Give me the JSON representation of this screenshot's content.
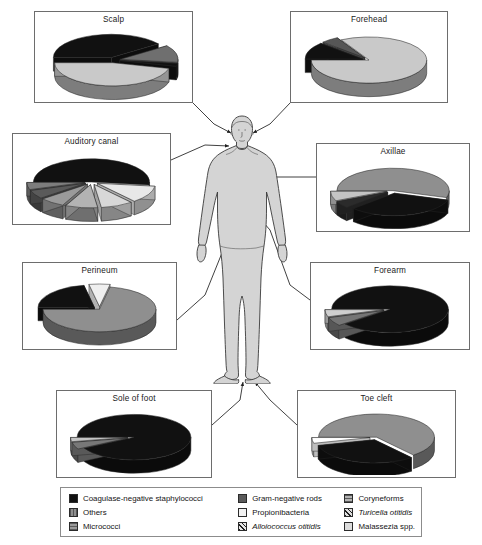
{
  "figure": {
    "body_figure_name": "human-body-silhouette"
  },
  "colors": {
    "cns": "#111111",
    "others": "#8f8f8f",
    "micrococci": "#9a9a9a",
    "gram_negative_rods": "#5a5a5a",
    "propionibacteria": "#f2f2f2",
    "alloiococcus": "#e8e8e8",
    "coryneforms": "#b3b3b3",
    "turicella": "#dedede",
    "malassezia": "#dcdcdc",
    "panel_border": "#6d6d6d",
    "legend_border": "#8c8c8c",
    "body_fill": "#d4d4d4",
    "body_stroke": "#3a3a3a",
    "connector": "#2b2b2b"
  },
  "legend": {
    "name": "taxa-legend",
    "columns": [
      {
        "entries": [
          {
            "label": "Coagulase-negative staphylococci",
            "swatch": "solid",
            "color": "#111111",
            "italic": false
          },
          {
            "label": "Others",
            "swatch": "vstripe",
            "color": "#8f8f8f",
            "italic": false
          },
          {
            "label": "Micrococci",
            "swatch": "grid",
            "color": "#9a9a9a",
            "italic": false
          }
        ]
      },
      {
        "entries": [
          {
            "label": "Gram-negative rods",
            "swatch": "solid",
            "color": "#5a5a5a",
            "italic": false
          },
          {
            "label": "Propionibacteria",
            "swatch": "solid",
            "color": "#f2f2f2",
            "italic": false
          },
          {
            "label": "Alloiococcus otitidis",
            "swatch": "diag",
            "color": "#e8e8e8",
            "italic": true
          }
        ]
      },
      {
        "entries": [
          {
            "label": "Coryneforms",
            "swatch": "hstripe",
            "color": "#b3b3b3",
            "italic": false
          },
          {
            "label": "Turicella otitidis",
            "swatch": "diag",
            "color": "#dedede",
            "italic": true
          },
          {
            "label": "Malassezia spp.",
            "swatch": "solid",
            "color": "#dcdcdc",
            "italic": false
          }
        ]
      }
    ]
  },
  "chart_data": [
    {
      "type": "pie",
      "title": "Scalp",
      "site": "scalp",
      "labels": [
        "Coagulase-negative staphylococci",
        "Coryneforms",
        "Others",
        "Malassezia spp."
      ],
      "values": [
        40,
        12,
        2,
        46
      ],
      "colors": [
        "#111111",
        "#6f6f6f",
        "#111111",
        "#c9c9c9"
      ],
      "exploded": [
        true,
        true,
        true,
        true
      ]
    },
    {
      "type": "pie",
      "title": "Forehead",
      "site": "forehead",
      "labels": [
        "Coagulase-negative staphylococci",
        "Coryneforms",
        "Propionibacteria"
      ],
      "values": [
        12,
        5,
        83
      ],
      "colors": [
        "#111111",
        "#565656",
        "#c9c9c9"
      ],
      "exploded": [
        true,
        true,
        false
      ]
    },
    {
      "type": "pie",
      "title": "Auditory canal",
      "site": "auditory-canal",
      "labels": [
        "Coagulase-negative staphylococci",
        "Alloiococcus otitidis",
        "Turicella otitidis",
        "Coryneforms",
        "Micrococci",
        "Gram-negative rods",
        "Others"
      ],
      "values": [
        52,
        12,
        9,
        9,
        7,
        6,
        5
      ],
      "colors": [
        "#111111",
        "#e8e8e8",
        "#d8d8d8",
        "#b3b3b3",
        "#9a9a9a",
        "#5a5a5a",
        "#7d7d7d"
      ],
      "exploded": [
        false,
        true,
        true,
        true,
        true,
        true,
        true
      ]
    },
    {
      "type": "pie",
      "title": "Axillae",
      "site": "axillae",
      "labels": [
        "Coryneforms",
        "Coagulase-negative staphylococci",
        "Others",
        "Micrococci"
      ],
      "values": [
        55,
        33,
        5,
        7
      ],
      "colors": [
        "#8f8f8f",
        "#111111",
        "#2b2b2b",
        "#c4c4c4"
      ],
      "exploded": [
        false,
        true,
        true,
        true
      ]
    },
    {
      "type": "pie",
      "title": "Perineum",
      "site": "perineum",
      "labels": [
        "Coagulase-negative staphylococci",
        "Gram-negative rods",
        "Coryneforms"
      ],
      "values": [
        22,
        6,
        72
      ],
      "colors": [
        "#111111",
        "#efefef",
        "#8f8f8f"
      ],
      "exploded": [
        true,
        true,
        false
      ]
    },
    {
      "type": "pie",
      "title": "Forearm",
      "site": "forearm",
      "labels": [
        "Coagulase-negative staphylococci",
        "Coryneforms",
        "Propionibacteria"
      ],
      "values": [
        89,
        6,
        5
      ],
      "colors": [
        "#111111",
        "#757575",
        "#cfcfcf"
      ],
      "exploded": [
        false,
        true,
        true
      ]
    },
    {
      "type": "pie",
      "title": "Sole of foot",
      "site": "sole-of-foot",
      "labels": [
        "Coagulase-negative staphylococci",
        "Coryneforms",
        "Micrococci"
      ],
      "values": [
        92,
        5,
        3
      ],
      "colors": [
        "#111111",
        "#787878",
        "#c4c4c4"
      ],
      "exploded": [
        false,
        true,
        true
      ]
    },
    {
      "type": "pie",
      "title": "Toe cleft",
      "site": "toe-cleft",
      "labels": [
        "Coryneforms",
        "Coagulase-negative staphylococci",
        "Others"
      ],
      "values": [
        64,
        32,
        4
      ],
      "colors": [
        "#8f8f8f",
        "#111111",
        "#ffffff"
      ],
      "exploded": [
        false,
        true,
        true
      ]
    }
  ],
  "panels": [
    {
      "title": "Scalp",
      "x": 34,
      "y": 11,
      "w": 159,
      "h": 92
    },
    {
      "title": "Forehead",
      "x": 290,
      "y": 11,
      "w": 158,
      "h": 92
    },
    {
      "title": "Auditory canal",
      "x": 12,
      "y": 133,
      "w": 159,
      "h": 92
    },
    {
      "title": "Axillae",
      "x": 316,
      "y": 143,
      "w": 154,
      "h": 89
    },
    {
      "title": "Perineum",
      "x": 22,
      "y": 262,
      "w": 155,
      "h": 88
    },
    {
      "title": "Forearm",
      "x": 310,
      "y": 262,
      "w": 160,
      "h": 88
    },
    {
      "title": "Sole of foot",
      "x": 56,
      "y": 390,
      "w": 156,
      "h": 88
    },
    {
      "title": "Toe cleft",
      "x": 297,
      "y": 390,
      "w": 159,
      "h": 88
    }
  ]
}
